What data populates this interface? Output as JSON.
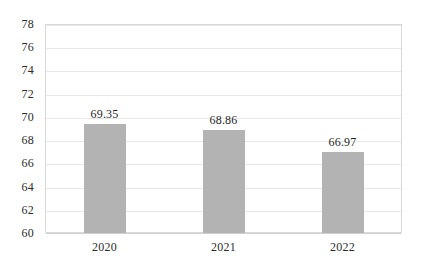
{
  "chart_data": {
    "type": "bar",
    "title": "",
    "xlabel": "",
    "ylabel": "",
    "categories": [
      "2020",
      "2021",
      "2022"
    ],
    "values": [
      69.35,
      68.86,
      66.97
    ],
    "value_labels": [
      "69.35",
      "68.86",
      "66.97"
    ],
    "ylim": [
      60,
      78
    ],
    "ytick_step": 2,
    "yticks": [
      78,
      76,
      74,
      72,
      70,
      68,
      66,
      64,
      62,
      60
    ],
    "ytick_labels": [
      "78",
      "76",
      "74",
      "72",
      "70",
      "68",
      "66",
      "64",
      "62",
      "60"
    ],
    "grid": true,
    "grid_axis": "y",
    "legend": false,
    "legend_position": "none",
    "series": [
      {
        "name": "",
        "values": [
          69.35,
          68.86,
          66.97
        ]
      }
    ]
  },
  "style": {
    "bar_color": "#b3b3b3",
    "grid_color": "#e8e8e8",
    "axis_color": "#d9d9d9",
    "text_color": "#2b2b2b",
    "background": "#ffffff"
  }
}
